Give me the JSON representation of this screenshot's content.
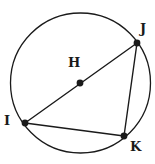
{
  "figure": {
    "kind": "circle-with-inscribed-triangle",
    "width": 155,
    "height": 164,
    "background_color": "#ffffff",
    "stroke_color": "#1a1a1a",
    "point_fill_color": "#1a1a1a",
    "circle": {
      "name": "circle-H",
      "center_label": "H",
      "cx": 80.5,
      "cy": 83,
      "r": 70,
      "stroke_width": 1.3
    },
    "points": [
      {
        "id": "H",
        "label": "H",
        "role": "center",
        "x": 80,
        "y": 83,
        "label_x": 68,
        "label_y": 56,
        "dot_radius": 3.4
      },
      {
        "id": "J",
        "label": "J",
        "role": "on-circle",
        "x": 137,
        "y": 43,
        "label_x": 140,
        "label_y": 22,
        "dot_radius": 3.4
      },
      {
        "id": "I",
        "label": "I",
        "role": "on-circle",
        "x": 25,
        "y": 123,
        "label_x": 4,
        "label_y": 114,
        "dot_radius": 3.4
      },
      {
        "id": "K",
        "label": "K",
        "role": "on-circle",
        "x": 124,
        "y": 136,
        "label_x": 130,
        "label_y": 140,
        "dot_radius": 3.4
      }
    ],
    "segments": [
      {
        "name": "segment-IJ",
        "from": "I",
        "to": "J",
        "x1": 25,
        "y1": 123,
        "x2": 137,
        "y2": 43,
        "stroke_width": 1.4,
        "note": "diameter through center H"
      },
      {
        "name": "segment-JK",
        "from": "J",
        "to": "K",
        "x1": 137,
        "y1": 43,
        "x2": 124,
        "y2": 136,
        "stroke_width": 1.4,
        "note": "chord"
      },
      {
        "name": "segment-IK",
        "from": "I",
        "to": "K",
        "x1": 25,
        "y1": 123,
        "x2": 124,
        "y2": 136,
        "stroke_width": 1.4,
        "note": "chord"
      }
    ]
  }
}
